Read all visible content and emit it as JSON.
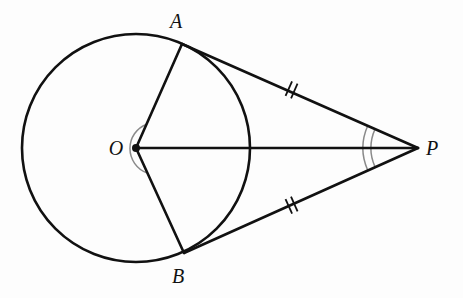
{
  "figure": {
    "background_color": "#fdfdfd",
    "stroke_color": "#111111",
    "mark_color": "#8a8a8a",
    "width": 463,
    "height": 298
  },
  "points": {
    "center": {
      "label": "O",
      "x": 136,
      "y": 148,
      "label_x": 116,
      "label_y": 155
    },
    "tangent_upper": {
      "label": "A",
      "x": 182,
      "y": 44,
      "label_x": 176,
      "label_y": 28
    },
    "tangent_lower": {
      "label": "B",
      "x": 184,
      "y": 253,
      "label_x": 178,
      "label_y": 283
    },
    "external": {
      "label": "P",
      "x": 418,
      "y": 148,
      "label_x": 432,
      "label_y": 155
    }
  },
  "circle": {
    "name": "circle-O",
    "cx": 136,
    "cy": 148,
    "r": 114,
    "stroke_width": 2.6
  },
  "segments": [
    {
      "name": "radius-OA",
      "from": "O",
      "to": "A",
      "x1": 136,
      "y1": 148,
      "x2": 182,
      "y2": 44,
      "stroke_width": 2.6
    },
    {
      "name": "radius-OB",
      "from": "O",
      "to": "B",
      "x1": 136,
      "y1": 148,
      "x2": 184,
      "y2": 253,
      "stroke_width": 2.6
    },
    {
      "name": "segment-OP",
      "from": "O",
      "to": "P",
      "x1": 136,
      "y1": 148,
      "x2": 418,
      "y2": 148,
      "stroke_width": 2.6
    },
    {
      "name": "tangent-AP",
      "from": "A",
      "to": "P",
      "x1": 182,
      "y1": 44,
      "x2": 418,
      "y2": 148,
      "stroke_width": 2.6
    },
    {
      "name": "tangent-BP",
      "from": "B",
      "to": "P",
      "x1": 184,
      "y1": 253,
      "x2": 418,
      "y2": 148,
      "stroke_width": 2.6
    }
  ],
  "tick_marks": [
    {
      "name": "tick-mark-AP",
      "on_segment": "tangent-AP",
      "count": 2,
      "cx": 292,
      "cy": 90,
      "angle_deg": 23.8
    },
    {
      "name": "tick-mark-BP",
      "on_segment": "tangent-BP",
      "count": 2,
      "cx": 292,
      "cy": 205,
      "angle_deg": -24.2
    }
  ],
  "angle_arcs": [
    {
      "name": "angle-arc-AOB",
      "vertex": "O",
      "count": 1,
      "radii": [
        26
      ],
      "start_deg": -66.1,
      "end_deg": 65.4
    },
    {
      "name": "angle-arc-APB",
      "vertex": "P",
      "count": 2,
      "radii": [
        47,
        55
      ],
      "start_deg": 156.2,
      "end_deg": 203.8
    }
  ],
  "center_dot": {
    "name": "center-point-dot",
    "cx": 136,
    "cy": 148,
    "r": 4
  }
}
